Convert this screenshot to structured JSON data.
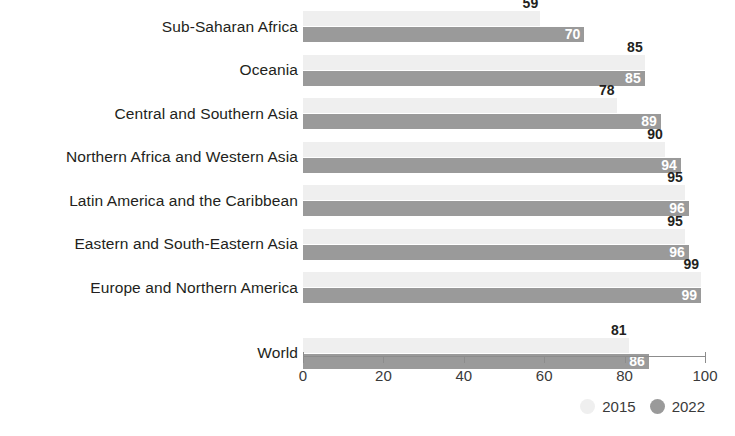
{
  "chart_data": {
    "type": "bar",
    "orientation": "horizontal",
    "title": "",
    "xlabel": "",
    "ylabel": "",
    "xlim": [
      0,
      100
    ],
    "xticks": [
      0,
      20,
      40,
      60,
      80,
      100
    ],
    "xtick_labels": [
      "0",
      "20",
      "40",
      "60",
      "80",
      "100"
    ],
    "grid": false,
    "legend_position": "bottom-right",
    "categories": [
      "Sub-Saharan Africa",
      "Oceania",
      "Central and Southern Asia",
      "Northern Africa and Western Asia",
      "Latin America and the Caribbean",
      "Eastern and South-Eastern Asia",
      "Europe and Northern America",
      "World"
    ],
    "series": [
      {
        "name": "2015",
        "color": "#efefef",
        "values": [
          59,
          85,
          78,
          90,
          95,
          95,
          99,
          81
        ]
      },
      {
        "name": "2022",
        "color": "#9a9a9a",
        "values": [
          70,
          85,
          89,
          94,
          96,
          96,
          99,
          86
        ]
      }
    ]
  },
  "legend": {
    "items": [
      {
        "label": "2015",
        "swatch": "circle-swatch-2015"
      },
      {
        "label": "2022",
        "swatch": "circle-swatch-2022"
      }
    ]
  },
  "colors": {
    "series_2015": "#efefef",
    "series_2022": "#9a9a9a",
    "axis": "#8c8c8c",
    "text": "#231f20",
    "value_label_inside": "#ffffff",
    "background": "#ffffff"
  }
}
